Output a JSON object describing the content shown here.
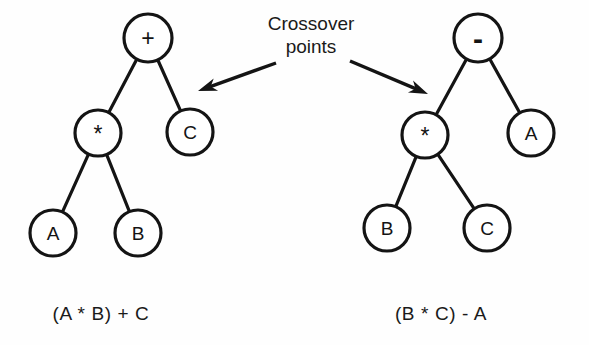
{
  "figure": {
    "background_color": "#fefefe",
    "ink_color": "#141414",
    "annotation": {
      "line1": "Crossover",
      "line2": "points"
    },
    "captions": {
      "left": "(A  * B) + C",
      "right": "(B  * C) - A"
    },
    "trees": [
      {
        "id": "left-tree",
        "expression": "(A * B) + C",
        "nodes": [
          {
            "id": "L-root",
            "label": "+",
            "kind": "operator",
            "cx": 148,
            "cy": 38,
            "r": 24
          },
          {
            "id": "L-mul",
            "label": "*",
            "kind": "operator",
            "cx": 98,
            "cy": 133,
            "r": 23
          },
          {
            "id": "L-c",
            "label": "C",
            "kind": "terminal",
            "cx": 190,
            "cy": 132,
            "r": 23
          },
          {
            "id": "L-a",
            "label": "A",
            "kind": "terminal",
            "cx": 53,
            "cy": 233,
            "r": 23
          },
          {
            "id": "L-b",
            "label": "B",
            "kind": "terminal",
            "cx": 138,
            "cy": 233,
            "r": 23
          }
        ],
        "edges": [
          {
            "from": "L-root",
            "to": "L-mul"
          },
          {
            "from": "L-root",
            "to": "L-c"
          },
          {
            "from": "L-mul",
            "to": "L-a"
          },
          {
            "from": "L-mul",
            "to": "L-b"
          }
        ],
        "caption_x": 101,
        "caption_y": 320
      },
      {
        "id": "right-tree",
        "expression": "(B * C) - A",
        "nodes": [
          {
            "id": "R-root",
            "label": "-",
            "kind": "operator",
            "cx": 478,
            "cy": 38,
            "r": 24
          },
          {
            "id": "R-mul",
            "label": "*",
            "kind": "operator",
            "cx": 425,
            "cy": 135,
            "r": 23
          },
          {
            "id": "R-a",
            "label": "A",
            "kind": "terminal",
            "cx": 531,
            "cy": 133,
            "r": 23
          },
          {
            "id": "R-b",
            "label": "B",
            "kind": "terminal",
            "cx": 387,
            "cy": 228,
            "r": 23
          },
          {
            "id": "R-c",
            "label": "C",
            "kind": "terminal",
            "cx": 487,
            "cy": 228,
            "r": 23
          }
        ],
        "edges": [
          {
            "from": "R-root",
            "to": "R-mul"
          },
          {
            "from": "R-root",
            "to": "R-a"
          },
          {
            "from": "R-mul",
            "to": "R-b"
          },
          {
            "from": "R-mul",
            "to": "R-c"
          }
        ],
        "caption_x": 441,
        "caption_y": 320
      }
    ],
    "arrows": [
      {
        "id": "arrow-left",
        "x1": 276,
        "y1": 63,
        "x2": 198,
        "y2": 91,
        "points_to": "left-tree-crossover-edge"
      },
      {
        "id": "arrow-right",
        "x1": 350,
        "y1": 61,
        "x2": 428,
        "y2": 94,
        "points_to": "right-tree-crossover-edge"
      }
    ],
    "annotation_pos": {
      "x": 311,
      "y": 30,
      "line_gap": 23
    }
  }
}
